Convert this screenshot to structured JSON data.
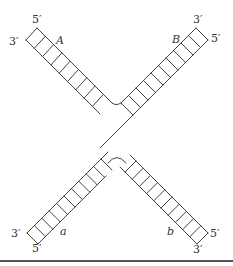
{
  "figure": {
    "type": "Holliday junction diagram",
    "arms": [
      {
        "id": "A",
        "label": "A",
        "position": "top-left",
        "end_labels": {
          "outer_strand": "5'",
          "inner_strand": "3'"
        }
      },
      {
        "id": "B",
        "label": "B",
        "position": "top-right",
        "end_labels": {
          "outer_strand": "3'",
          "inner_strand": "5'"
        }
      },
      {
        "id": "a",
        "label": "a",
        "position": "bottom-left",
        "end_labels": {
          "outer_strand": "3'",
          "inner_strand": "5'"
        }
      },
      {
        "id": "b",
        "label": "b",
        "position": "bottom-right",
        "end_labels": {
          "outer_strand": "5'",
          "inner_strand": "3'"
        }
      }
    ],
    "labels": {
      "A_5": "5′",
      "A_3": "3′",
      "A_name": "A",
      "B_3": "3′",
      "B_5": "5′",
      "B_name": "B",
      "a_3": "3′",
      "a_5": "5′",
      "a_name": "a",
      "b_5": "5′",
      "b_3": "3′",
      "b_name": "b"
    },
    "colors": {
      "stroke": "#444444",
      "text": "#333333",
      "rule": "#555555"
    }
  }
}
